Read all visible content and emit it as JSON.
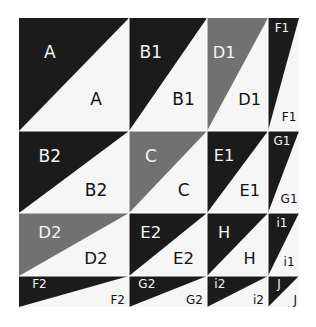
{
  "diagram": {
    "title": "",
    "colors": {
      "dark": "#1b1b1b",
      "gray": "#717171",
      "light": "#f6f6f6",
      "text_on_dark": "#f4f4f4",
      "text_on_light": "#111111"
    },
    "columns": [
      19,
      129,
      207,
      268,
      299
    ],
    "rows": [
      18,
      131,
      213,
      276,
      307
    ],
    "cells": [
      {
        "row": 0,
        "col": 0,
        "fill": "dark",
        "label_upper": "A",
        "label_lower": "A"
      },
      {
        "row": 0,
        "col": 1,
        "fill": "dark",
        "label_upper": "B1",
        "label_lower": "B1"
      },
      {
        "row": 0,
        "col": 2,
        "fill": "gray",
        "label_upper": "D1",
        "label_lower": "D1"
      },
      {
        "row": 0,
        "col": 3,
        "fill": "dark",
        "label_upper": "F1",
        "label_lower": "F1"
      },
      {
        "row": 1,
        "col": 0,
        "fill": "dark",
        "label_upper": "B2",
        "label_lower": "B2"
      },
      {
        "row": 1,
        "col": 1,
        "fill": "gray",
        "label_upper": "C",
        "label_lower": "C"
      },
      {
        "row": 1,
        "col": 2,
        "fill": "dark",
        "label_upper": "E1",
        "label_lower": "E1"
      },
      {
        "row": 1,
        "col": 3,
        "fill": "dark",
        "label_upper": "G1",
        "label_lower": "G1"
      },
      {
        "row": 2,
        "col": 0,
        "fill": "gray",
        "label_upper": "D2",
        "label_lower": "D2"
      },
      {
        "row": 2,
        "col": 1,
        "fill": "dark",
        "label_upper": "E2",
        "label_lower": "E2"
      },
      {
        "row": 2,
        "col": 2,
        "fill": "dark",
        "label_upper": "H",
        "label_lower": "H"
      },
      {
        "row": 2,
        "col": 3,
        "fill": "dark",
        "label_upper": "i1",
        "label_lower": "i1"
      },
      {
        "row": 3,
        "col": 0,
        "fill": "dark",
        "label_upper": "F2",
        "label_lower": "F2"
      },
      {
        "row": 3,
        "col": 1,
        "fill": "dark",
        "label_upper": "G2",
        "label_lower": "G2"
      },
      {
        "row": 3,
        "col": 2,
        "fill": "dark",
        "label_upper": "i2",
        "label_lower": "i2"
      },
      {
        "row": 3,
        "col": 3,
        "fill": "dark",
        "label_upper": "J",
        "label_lower": "J"
      }
    ]
  }
}
